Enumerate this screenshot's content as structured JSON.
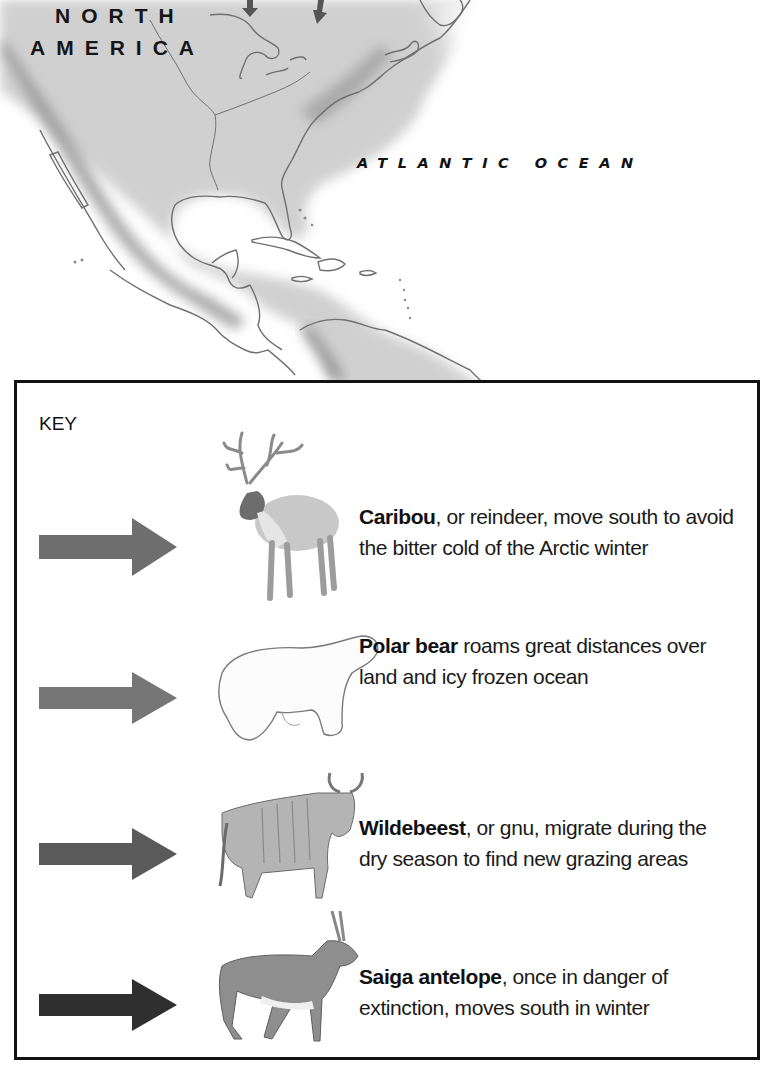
{
  "map": {
    "continent_label_line1": "NORTH",
    "continent_label_line2": "AMERICA",
    "ocean_label": "ATLANTIC OCEAN",
    "colors": {
      "land": "#c9c9c9",
      "mountains": "#8a8a8a",
      "coast": "#6f6f6f",
      "water": "#ffffff"
    },
    "map_arrows": [
      {
        "id": "arrow-top-1",
        "direction": "down"
      },
      {
        "id": "arrow-top-2",
        "direction": "down"
      }
    ]
  },
  "key": {
    "title": "KEY",
    "entries": [
      {
        "animal": "caribou",
        "name": "Caribou",
        "text": ", or reindeer, move south to avoid the bitter cold of the Arctic winter",
        "arrow_color": "#6e6e6e"
      },
      {
        "animal": "polar-bear",
        "name": "Polar bear",
        "text": " roams great distances over land and icy frozen ocean",
        "arrow_color": "#767676"
      },
      {
        "animal": "wildebeest",
        "name": "Wildebeest",
        "text": ", or gnu, migrate during the dry season to find new grazing areas",
        "arrow_color": "#5a5a5a"
      },
      {
        "animal": "saiga-antelope",
        "name": "Saiga antelope",
        "text": ", once in danger of extinction, moves south in winter",
        "arrow_color": "#2f2f2f"
      }
    ]
  }
}
